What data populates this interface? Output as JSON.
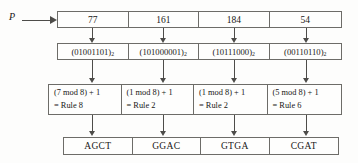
{
  "diagram": {
    "input_label": "P",
    "rows": {
      "values": {
        "name": "key-values-row",
        "cells": [
          "77",
          "161",
          "184",
          "54"
        ]
      },
      "binary": {
        "name": "binary-representation-row",
        "cells": [
          {
            "open": "(01001101)",
            "sub": "2"
          },
          {
            "open": "(101000001)",
            "sub": "2"
          },
          {
            "open": "(10111000)",
            "sub": "2"
          },
          {
            "open": "(00110110)",
            "sub": "2"
          }
        ]
      },
      "rules": {
        "name": "rule-selection-row",
        "cells": [
          {
            "expr": "(7 mod 8) + 1",
            "result": "= Rule 8"
          },
          {
            "expr": "(1 mod 8) + 1",
            "result": "= Rule 2"
          },
          {
            "expr": "(1 mod 8) + 1",
            "result": "= Rule 2"
          },
          {
            "expr": "(5 mod 8) + 1",
            "result": "= Rule 6"
          }
        ]
      },
      "dna": {
        "name": "dna-sequence-row",
        "cells": [
          "AGCT",
          "GGAC",
          "GTGA",
          "CGAT"
        ]
      }
    },
    "colors": {
      "border": "#6d6c68",
      "arrow": "#4d4c49",
      "text": "#181716",
      "background": "#fdfdfc"
    }
  }
}
